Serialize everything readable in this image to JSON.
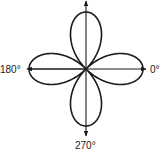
{
  "diagram": {
    "type": "polar-pattern",
    "center": [
      86,
      69
    ],
    "lobe_length": 57,
    "line_color": "#1a1a1a",
    "axis_labels": {
      "right": "0°",
      "left": "180°",
      "bottom": "270°"
    }
  }
}
